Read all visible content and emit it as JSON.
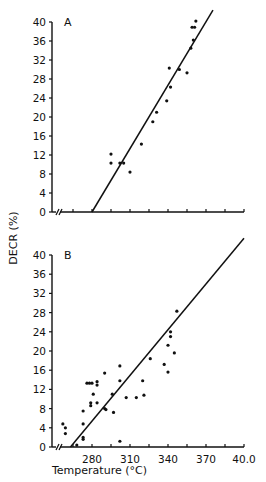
{
  "chart_data": [
    {
      "type": "scatter",
      "panel": "A",
      "title": "",
      "xlabel": "Temperature (°C)",
      "ylabel": "DECR (%)",
      "xlim": [
        250,
        400
      ],
      "ylim": [
        0,
        40
      ],
      "yticks": [
        0,
        4,
        8,
        12,
        16,
        20,
        24,
        28,
        32,
        36,
        40
      ],
      "xtick_step": 15,
      "axis_break": true,
      "grid": false,
      "legend": null,
      "points": [
        {
          "x": 295,
          "y": 12.2
        },
        {
          "x": 295,
          "y": 10.3
        },
        {
          "x": 302,
          "y": 10.3
        },
        {
          "x": 305,
          "y": 10.3
        },
        {
          "x": 310,
          "y": 8.4
        },
        {
          "x": 319,
          "y": 14.3
        },
        {
          "x": 328,
          "y": 19.0
        },
        {
          "x": 331,
          "y": 21.0
        },
        {
          "x": 339,
          "y": 23.4
        },
        {
          "x": 342,
          "y": 26.3
        },
        {
          "x": 341,
          "y": 30.3
        },
        {
          "x": 349,
          "y": 30.0
        },
        {
          "x": 355,
          "y": 29.3
        },
        {
          "x": 358,
          "y": 34.5
        },
        {
          "x": 360,
          "y": 36.2
        },
        {
          "x": 359,
          "y": 38.9
        },
        {
          "x": 361,
          "y": 38.9
        },
        {
          "x": 362,
          "y": 40.2
        }
      ],
      "fit_line": {
        "x0": 280,
        "y0": 0,
        "x1": 375.5,
        "y1": 42.5
      }
    },
    {
      "type": "scatter",
      "panel": "B",
      "title": "",
      "xlabel": "Temperature (°C)",
      "ylabel": "DECR (%)",
      "xlim": [
        250,
        400
      ],
      "ylim": [
        0,
        40
      ],
      "xticks": [
        280,
        310,
        340,
        370,
        400
      ],
      "xticklabels": [
        "280",
        "310",
        "340",
        "370",
        "40.0"
      ],
      "yticks": [
        0,
        4,
        8,
        12,
        16,
        20,
        24,
        28,
        32,
        36,
        40
      ],
      "axis_break": true,
      "grid": false,
      "legend": null,
      "points": [
        {
          "x": 257,
          "y": 4.8
        },
        {
          "x": 259,
          "y": 4.0
        },
        {
          "x": 259,
          "y": 2.8
        },
        {
          "x": 268,
          "y": 0.4
        },
        {
          "x": 273,
          "y": 7.5
        },
        {
          "x": 273,
          "y": 4.8
        },
        {
          "x": 273,
          "y": 2.0
        },
        {
          "x": 273,
          "y": 1.6
        },
        {
          "x": 276,
          "y": 13.3
        },
        {
          "x": 278,
          "y": 13.3
        },
        {
          "x": 279,
          "y": 9.2
        },
        {
          "x": 279,
          "y": 8.6
        },
        {
          "x": 280,
          "y": 13.3
        },
        {
          "x": 281,
          "y": 11.0
        },
        {
          "x": 284,
          "y": 13.6
        },
        {
          "x": 284,
          "y": 12.9
        },
        {
          "x": 284,
          "y": 9.2
        },
        {
          "x": 290,
          "y": 15.4
        },
        {
          "x": 290,
          "y": 8.0
        },
        {
          "x": 291,
          "y": 7.8
        },
        {
          "x": 297,
          "y": 7.2
        },
        {
          "x": 296,
          "y": 11.0
        },
        {
          "x": 302,
          "y": 16.9
        },
        {
          "x": 302,
          "y": 13.8
        },
        {
          "x": 302,
          "y": 1.2
        },
        {
          "x": 307,
          "y": 10.3
        },
        {
          "x": 315,
          "y": 10.3
        },
        {
          "x": 320,
          "y": 13.8
        },
        {
          "x": 321,
          "y": 10.8
        },
        {
          "x": 326,
          "y": 18.4
        },
        {
          "x": 337,
          "y": 17.2
        },
        {
          "x": 340,
          "y": 15.6
        },
        {
          "x": 340,
          "y": 21.2
        },
        {
          "x": 342,
          "y": 24.0
        },
        {
          "x": 342,
          "y": 23.0
        },
        {
          "x": 345,
          "y": 19.6
        },
        {
          "x": 347,
          "y": 28.3
        }
      ],
      "fit_line": {
        "x0": 263,
        "y0": 0,
        "x1": 400,
        "y1": 43.5
      }
    }
  ],
  "panels": {
    "a": {
      "label": "A"
    },
    "b": {
      "label": "B"
    }
  },
  "axes": {
    "ylabel": "DECR (%)",
    "xlabel": "Temperature (°C)",
    "y_tick_labels": [
      "0",
      "4",
      "8",
      "12",
      "16",
      "20",
      "24",
      "28",
      "32",
      "36",
      "40"
    ],
    "x_tick_labels": [
      "280",
      "310",
      "340",
      "370",
      "40.0"
    ]
  }
}
